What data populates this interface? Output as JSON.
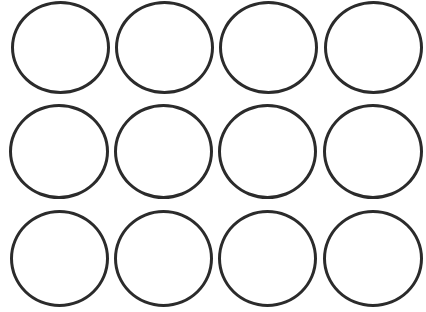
{
  "grid": {
    "rows": 3,
    "cols": 4,
    "stroke_color": "#2b2b2b",
    "fill_color": "#ffffff",
    "circles": [
      {
        "row": 1,
        "col": 1,
        "x": 11,
        "y": 1,
        "w": 99,
        "h": 93
      },
      {
        "row": 1,
        "col": 2,
        "x": 115,
        "y": 1,
        "w": 99,
        "h": 93
      },
      {
        "row": 1,
        "col": 3,
        "x": 219,
        "y": 1,
        "w": 99,
        "h": 93
      },
      {
        "row": 1,
        "col": 4,
        "x": 324,
        "y": 1,
        "w": 99,
        "h": 93
      },
      {
        "row": 2,
        "col": 1,
        "x": 9,
        "y": 104,
        "w": 100,
        "h": 95
      },
      {
        "row": 2,
        "col": 2,
        "x": 114,
        "y": 104,
        "w": 99,
        "h": 95
      },
      {
        "row": 2,
        "col": 3,
        "x": 218,
        "y": 104,
        "w": 99,
        "h": 95
      },
      {
        "row": 2,
        "col": 4,
        "x": 323,
        "y": 104,
        "w": 100,
        "h": 95
      },
      {
        "row": 3,
        "col": 1,
        "x": 10,
        "y": 210,
        "w": 99,
        "h": 97
      },
      {
        "row": 3,
        "col": 2,
        "x": 114,
        "y": 210,
        "w": 99,
        "h": 97
      },
      {
        "row": 3,
        "col": 3,
        "x": 218,
        "y": 210,
        "w": 99,
        "h": 97
      },
      {
        "row": 3,
        "col": 4,
        "x": 323,
        "y": 210,
        "w": 100,
        "h": 97
      }
    ]
  }
}
